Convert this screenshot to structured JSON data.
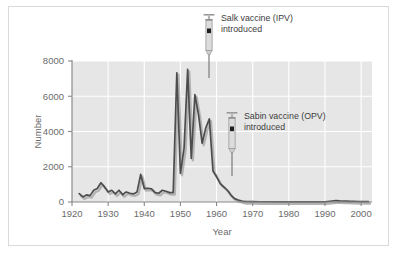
{
  "figure": {
    "border_color": "#d9d9d9",
    "canvas_color": "#ffffff",
    "plot_bg_color": "#e6e6e6",
    "grid_color": "#ffffff",
    "axis_color": "#8a8a8a",
    "line_color": "#4d4d4d",
    "shadow_color": "#b3b3b3",
    "text_color": "#6b6b6b"
  },
  "chart_data": {
    "type": "line",
    "title": "",
    "xlabel": "Year",
    "ylabel": "Number",
    "xlim": [
      1918,
      2001
    ],
    "ylim": [
      0,
      8400
    ],
    "xticks": [
      1920,
      1930,
      1940,
      1950,
      1960,
      1970,
      1980,
      1990,
      2000
    ],
    "xtick_labels": [
      "1920",
      "1930",
      "1940",
      "1950",
      "1960",
      "1970",
      "1980",
      "1990",
      "2000"
    ],
    "yticks": [
      0,
      2000,
      4000,
      6000,
      8000
    ],
    "ytick_labels": [
      "0",
      "2000",
      "4000",
      "6000",
      "8000"
    ],
    "grid": true,
    "legend": "none",
    "series": [
      {
        "name": "Paralytic poliomyelitis cases",
        "x": [
          1920,
          1921,
          1922,
          1923,
          1924,
          1925,
          1926,
          1927,
          1928,
          1929,
          1930,
          1931,
          1932,
          1933,
          1934,
          1935,
          1936,
          1937,
          1938,
          1939,
          1940,
          1941,
          1942,
          1943,
          1944,
          1945,
          1946,
          1947,
          1948,
          1949,
          1950,
          1951,
          1952,
          1953,
          1954,
          1955,
          1956,
          1957,
          1958,
          1959,
          1960,
          1961,
          1962,
          1963,
          1964,
          1965,
          1966,
          1967,
          1968,
          1970,
          1975,
          1980,
          1985,
          1988,
          1990,
          1991,
          1992,
          1993,
          1994,
          1995,
          1996,
          1997,
          1998,
          2000
        ],
        "values": [
          500,
          300,
          420,
          380,
          700,
          800,
          1150,
          900,
          600,
          700,
          480,
          700,
          430,
          600,
          520,
          480,
          600,
          1650,
          800,
          820,
          780,
          560,
          520,
          700,
          640,
          560,
          560,
          7700,
          1700,
          3200,
          7900,
          2600,
          6400,
          5200,
          3500,
          4400,
          4950,
          1850,
          1500,
          1100,
          900,
          700,
          400,
          200,
          120,
          60,
          30,
          20,
          20,
          15,
          10,
          8,
          6,
          5,
          60,
          90,
          70,
          60,
          55,
          40,
          35,
          30,
          25,
          20
        ],
        "color": "#4d4d4d"
      }
    ],
    "annotations": [
      {
        "id": "salk",
        "icon": "syringe-icon",
        "label_line1": "Salk vaccine (IPV)",
        "label_line2": "introduced",
        "year": 1955
      },
      {
        "id": "sabin",
        "icon": "syringe-icon",
        "label_line1": "Sabin vaccine (OPV)",
        "label_line2": "introduced",
        "year": 1962
      }
    ]
  }
}
